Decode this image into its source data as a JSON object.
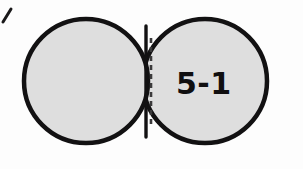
{
  "figure": {
    "name": "twin-disc-stack-diagram",
    "background_color": "#fdfdfd",
    "outline_color": "#121112",
    "disc_fill_color": "#dedede",
    "label": "5-1",
    "corner_mark": "/",
    "left_disc": {
      "name": "left-disc",
      "cx": 86,
      "cy": 81,
      "r": 62,
      "fill": "#dedede",
      "stroke": "#121112",
      "stroke_width": 4
    },
    "right_disc": {
      "name": "right-disc",
      "cx": 205,
      "cy": 81,
      "r": 62,
      "fill": "#dedede",
      "stroke": "#121112",
      "stroke_width": 4
    },
    "stack_arcs": [
      {
        "name": "stack-arc-1",
        "offset_x": 7,
        "offset_y": -2
      },
      {
        "name": "stack-arc-2",
        "offset_x": 13,
        "offset_y": -4
      },
      {
        "name": "stack-arc-3",
        "offset_x": 19,
        "offset_y": -6
      }
    ],
    "seam": {
      "name": "disc-seam",
      "x": 146,
      "y_top": 27,
      "y_bottom": 136,
      "dash_x": 151,
      "dash_pattern": "5 4",
      "stroke_width": 3
    }
  }
}
